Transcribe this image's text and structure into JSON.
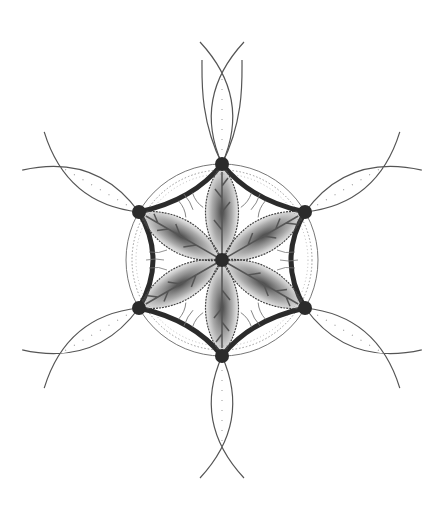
{
  "image": {
    "subject": "Pencil drawing of a six-petal geometric flower mandala",
    "center": [
      222,
      260
    ],
    "colors": {
      "background": "#ffffff",
      "graphite_dark": "#2b2b2b",
      "graphite_mid": "#555555",
      "graphite_light": "#9a9a9a"
    },
    "outer_circle_radius": 96,
    "hexagon_radius": 96,
    "petal_count": 6,
    "outer_petal_length": 200
  }
}
